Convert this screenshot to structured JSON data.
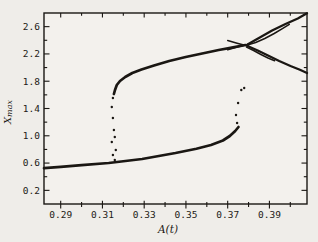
{
  "chart_data": {
    "type": "line",
    "title": "",
    "subtitle": "",
    "xlabel": "A(t)",
    "ylabel": "Xmax",
    "ylabel_main": "X",
    "ylabel_sub": "max",
    "xlim": [
      0.282,
      0.408
    ],
    "ylim": [
      0.0,
      2.8
    ],
    "grid": false,
    "frame": "box",
    "legend": "none",
    "ink_color": "#1a1713",
    "plot_bg_color": "#f3f1ed",
    "page_bg_color": "#efede9",
    "x_tick_values": [
      0.29,
      0.31,
      0.33,
      0.35,
      0.37,
      0.39
    ],
    "x_tick_labels": [
      "0.29",
      "0.31",
      "0.33",
      "0.35",
      "0.37",
      "0.39"
    ],
    "x_minor_ticks": [
      0.3,
      0.32,
      0.34,
      0.36,
      0.38,
      0.4
    ],
    "y_tick_values": [
      0.2,
      0.6,
      1.0,
      1.4,
      1.8,
      2.2,
      2.6
    ],
    "y_tick_labels": [
      "0.2",
      "0.6",
      "1.0",
      "1.4",
      "1.8",
      "2.2",
      "2.6"
    ],
    "y_minor_ticks": [
      0.4,
      0.8,
      1.2,
      1.6,
      2.0,
      2.4
    ],
    "series": [
      {
        "name": "lower-stable-branch",
        "thickness": 2.7,
        "points": [
          [
            0.282,
            0.527
          ],
          [
            0.29,
            0.545
          ],
          [
            0.3,
            0.57
          ],
          [
            0.313,
            0.601
          ],
          [
            0.329,
            0.66
          ],
          [
            0.345,
            0.748
          ],
          [
            0.355,
            0.81
          ],
          [
            0.362,
            0.865
          ],
          [
            0.3677,
            0.931
          ],
          [
            0.371,
            0.997
          ],
          [
            0.3736,
            1.07
          ],
          [
            0.3752,
            1.129
          ]
        ]
      },
      {
        "name": "upper-stable-branch",
        "thickness": 2.7,
        "points": [
          [
            0.3155,
            1.613
          ],
          [
            0.316,
            1.671
          ],
          [
            0.3169,
            1.744
          ],
          [
            0.3184,
            1.803
          ],
          [
            0.3209,
            1.862
          ],
          [
            0.3243,
            1.92
          ],
          [
            0.3287,
            1.972
          ],
          [
            0.3347,
            2.03
          ],
          [
            0.342,
            2.096
          ],
          [
            0.3499,
            2.155
          ],
          [
            0.3578,
            2.206
          ],
          [
            0.3657,
            2.257
          ],
          [
            0.3726,
            2.297
          ],
          [
            0.3785,
            2.331
          ]
        ]
      },
      {
        "name": "upper-arm-outer",
        "thickness": 2.3,
        "points": [
          [
            0.3795,
            2.338
          ],
          [
            0.3854,
            2.441
          ],
          [
            0.3913,
            2.543
          ],
          [
            0.3977,
            2.639
          ],
          [
            0.4036,
            2.719
          ],
          [
            0.408,
            2.795
          ]
        ]
      },
      {
        "name": "upper-arm-inner",
        "thickness": 1.5,
        "points": [
          [
            0.379,
            2.325
          ],
          [
            0.3834,
            2.367
          ],
          [
            0.3878,
            2.426
          ],
          [
            0.3923,
            2.499
          ],
          [
            0.3962,
            2.572
          ],
          [
            0.3995,
            2.635
          ]
        ]
      },
      {
        "name": "lower-arm-outer",
        "thickness": 2.3,
        "points": [
          [
            0.3795,
            2.316
          ],
          [
            0.3844,
            2.25
          ],
          [
            0.3893,
            2.177
          ],
          [
            0.3947,
            2.096
          ],
          [
            0.4001,
            2.023
          ],
          [
            0.4046,
            1.967
          ],
          [
            0.408,
            1.92
          ]
        ]
      },
      {
        "name": "lower-arm-inner",
        "thickness": 1.5,
        "points": [
          [
            0.379,
            2.3
          ],
          [
            0.3824,
            2.25
          ],
          [
            0.3859,
            2.191
          ],
          [
            0.3893,
            2.14
          ],
          [
            0.3925,
            2.1
          ]
        ]
      },
      {
        "name": "crossing-upper-tip",
        "thickness": 1.5,
        "points": [
          [
            0.37,
            2.397
          ],
          [
            0.3745,
            2.358
          ],
          [
            0.38,
            2.312
          ]
        ]
      },
      {
        "name": "crossing-lower-tip",
        "thickness": 1.5,
        "points": [
          [
            0.37,
            2.262
          ],
          [
            0.3745,
            2.302
          ],
          [
            0.38,
            2.342
          ]
        ]
      }
    ],
    "scatter": [
      {
        "name": "left-jump-transient-dots",
        "dot_radius": 1.2,
        "points": [
          [
            0.315,
            1.554
          ],
          [
            0.3145,
            1.422
          ],
          [
            0.315,
            1.261
          ],
          [
            0.3155,
            1.085
          ],
          [
            0.3159,
            0.982
          ],
          [
            0.3145,
            0.909
          ],
          [
            0.3164,
            0.792
          ],
          [
            0.315,
            0.718
          ],
          [
            0.3159,
            0.645
          ]
        ]
      },
      {
        "name": "right-jump-transient-dots",
        "dot_radius": 1.2,
        "points": [
          [
            0.3745,
            1.187
          ],
          [
            0.374,
            1.305
          ],
          [
            0.375,
            1.48
          ],
          [
            0.3765,
            1.671
          ],
          [
            0.3779,
            1.7
          ]
        ]
      }
    ]
  }
}
